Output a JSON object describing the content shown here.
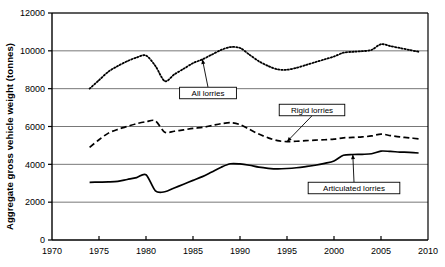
{
  "chart_data": {
    "type": "line",
    "title": "",
    "xlabel": "",
    "ylabel": "Aggregate gross vehicle weight (tonnes)",
    "xlim": [
      1970,
      2010
    ],
    "ylim": [
      0,
      12000
    ],
    "xticks": [
      1970,
      1975,
      1980,
      1985,
      1990,
      1995,
      2000,
      2005,
      2010
    ],
    "xtick_labels": [
      "1970",
      "1975",
      "1980",
      "1985",
      "1990",
      "1995",
      "2000",
      "2005",
      "2010"
    ],
    "yticks": [
      0,
      2000,
      4000,
      6000,
      8000,
      10000,
      12000
    ],
    "ytick_labels": [
      "0",
      "2000",
      "4000",
      "6000",
      "8000",
      "10000",
      "12000"
    ],
    "grid": "horizontal",
    "legend_position": "inline-annotations",
    "series": [
      {
        "name": "All lorries",
        "style": "dotted",
        "color": "#000000",
        "x": [
          1974,
          1975,
          1976,
          1977,
          1978,
          1979,
          1980,
          1981,
          1982,
          1983,
          1984,
          1985,
          1986,
          1987,
          1988,
          1989,
          1990,
          1991,
          1992,
          1993,
          1994,
          1995,
          1996,
          1997,
          1998,
          1999,
          2000,
          2001,
          2002,
          2003,
          2004,
          2005,
          2006,
          2007,
          2008,
          2009
        ],
        "values": [
          8000,
          8450,
          8900,
          9200,
          9450,
          9650,
          9750,
          9200,
          8400,
          8750,
          9050,
          9350,
          9550,
          9800,
          10050,
          10200,
          10150,
          9800,
          9450,
          9200,
          9020,
          9000,
          9100,
          9250,
          9400,
          9550,
          9700,
          9900,
          9950,
          9980,
          10050,
          10350,
          10250,
          10150,
          10050,
          9950
        ]
      },
      {
        "name": "Rigid lorries",
        "style": "dashed",
        "color": "#000000",
        "x": [
          1974,
          1975,
          1976,
          1977,
          1978,
          1979,
          1980,
          1981,
          1982,
          1983,
          1984,
          1985,
          1986,
          1987,
          1988,
          1989,
          1990,
          1991,
          1992,
          1993,
          1994,
          1995,
          1996,
          1997,
          1998,
          1999,
          2000,
          2001,
          2002,
          2003,
          2004,
          2005,
          2006,
          2007,
          2008,
          2009
        ],
        "values": [
          4900,
          5300,
          5650,
          5850,
          6000,
          6150,
          6250,
          6300,
          5700,
          5750,
          5820,
          5900,
          5950,
          6050,
          6150,
          6200,
          6100,
          5850,
          5600,
          5400,
          5250,
          5200,
          5220,
          5250,
          5280,
          5300,
          5330,
          5400,
          5420,
          5450,
          5500,
          5600,
          5520,
          5450,
          5400,
          5350
        ]
      },
      {
        "name": "Articulated lorries",
        "style": "solid",
        "color": "#000000",
        "x": [
          1974,
          1975,
          1976,
          1977,
          1978,
          1979,
          1980,
          1981,
          1982,
          1983,
          1984,
          1985,
          1986,
          1987,
          1988,
          1989,
          1990,
          1991,
          1992,
          1993,
          1994,
          1995,
          1996,
          1997,
          1998,
          1999,
          2000,
          2001,
          2002,
          2003,
          2004,
          2005,
          2006,
          2007,
          2008,
          2009
        ],
        "values": [
          3050,
          3060,
          3070,
          3100,
          3200,
          3300,
          3450,
          2600,
          2550,
          2750,
          2950,
          3150,
          3350,
          3600,
          3850,
          4030,
          4020,
          3950,
          3850,
          3790,
          3760,
          3780,
          3820,
          3880,
          3950,
          4050,
          4180,
          4480,
          4520,
          4530,
          4560,
          4700,
          4680,
          4650,
          4630,
          4600
        ]
      }
    ],
    "annotations": [
      {
        "label": "All lorries",
        "points_to_series": "All lorries",
        "points_to_year": 1986
      },
      {
        "label": "Rigid lorries",
        "points_to_series": "Rigid lorries",
        "points_to_year": 1995
      },
      {
        "label": "Articulated lorries",
        "points_to_series": "Articulated lorries",
        "points_to_year": 2002
      }
    ]
  }
}
